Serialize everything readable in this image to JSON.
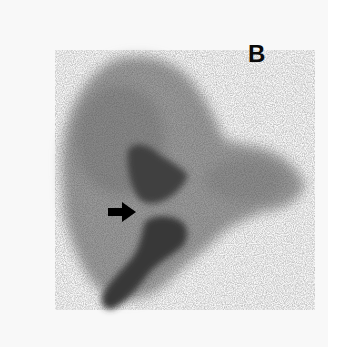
{
  "figure": {
    "panel_label": "B",
    "annotations": [
      {
        "type": "arrow",
        "direction": "right",
        "color": "#000000"
      }
    ],
    "colors": {
      "background": "#f8f8f8",
      "liver_activity": "#8a8a8a",
      "dense_activity": "#3a3a3a",
      "arrow": "#000000"
    }
  }
}
